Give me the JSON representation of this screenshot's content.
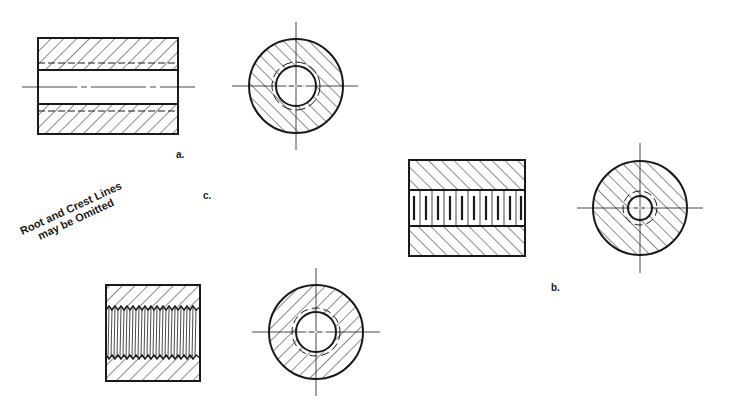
{
  "figure": {
    "labels": {
      "a": "a.",
      "b": "b.",
      "c": "c."
    },
    "note": {
      "line1": "Root and Crest Lines",
      "line2": "may be Omitted"
    },
    "views": [
      {
        "id": "a",
        "type": "detailed-thread-section",
        "box": [
          38,
          38,
          178,
          134
        ],
        "bore": [
          70,
          104
        ],
        "circle_center": [
          296,
          86
        ],
        "circle_outer_r": 47,
        "circle_inner_r": 20
      },
      {
        "id": "b",
        "type": "schematic-thread-section",
        "box": [
          409,
          160,
          525,
          256
        ],
        "bore": [
          190,
          226
        ],
        "circle_center": [
          640,
          208
        ],
        "circle_outer_r": 47,
        "circle_inner_r": 12
      },
      {
        "id": "c",
        "type": "simplified-thread-section",
        "box": [
          106,
          285,
          200,
          381
        ],
        "bore": [
          310,
          355
        ],
        "circle_center": [
          316,
          332
        ],
        "circle_outer_r": 47,
        "circle_inner_r": 20
      }
    ],
    "colors": {
      "line": "#1a1a1a",
      "background": "#ffffff"
    }
  }
}
